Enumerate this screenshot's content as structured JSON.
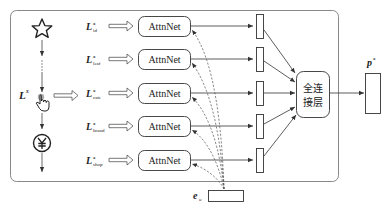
{
  "diagram": {
    "input_sequence_label": "L",
    "input_sequence_sup": "x",
    "left_icons": [
      "star-icon",
      "ellipsis-dots",
      "click-hand-icon",
      "yen-coin-icon"
    ],
    "rows": [
      {
        "label": "L",
        "sup": "x",
        "sub": "id",
        "module": "AttnNet"
      },
      {
        "label": "L",
        "sup": "x",
        "sub": "leaf",
        "module": "AttnNet"
      },
      {
        "label": "L",
        "sup": "x",
        "sub": "cate",
        "module": "AttnNet"
      },
      {
        "label": "L",
        "sup": "x",
        "sub": "brand",
        "module": "AttnNet"
      },
      {
        "label": "L",
        "sup": "x",
        "sub": "shop",
        "module": "AttnNet"
      }
    ],
    "fusion": {
      "line1": "全连",
      "line2": "接层"
    },
    "output": {
      "label": "p",
      "sup": "x"
    },
    "user_embedding": {
      "label": "e",
      "sub": "u"
    }
  }
}
